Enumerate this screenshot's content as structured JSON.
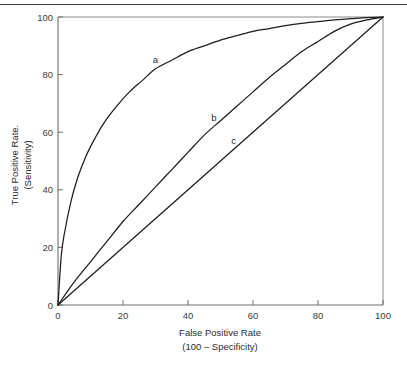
{
  "figure": {
    "has_top_rule": true,
    "background_color": "#ffffff",
    "ink_color": "#1d1d1d",
    "axis_color": "#6f6f6f"
  },
  "chart_data": {
    "type": "line",
    "title": "",
    "subtitle": "",
    "xlabel": "False Positive Rate",
    "xlabel_line2": "(100 – Specificity)",
    "ylabel": "True Positive Rate.",
    "ylabel_line2": "(Sensitivity)",
    "xlim": [
      0,
      100
    ],
    "ylim": [
      0,
      100
    ],
    "xticks": [
      0,
      20,
      40,
      60,
      80,
      100
    ],
    "yticks": [
      0,
      20,
      40,
      60,
      80,
      100
    ],
    "xtick_labels": [
      "0",
      "20",
      "40",
      "60",
      "80",
      "100"
    ],
    "ytick_labels": [
      "0",
      "20",
      "40",
      "60",
      "80",
      "100"
    ],
    "grid": false,
    "legend": "inline-curve-labels",
    "legend_position": "on-curve",
    "annotations": [
      {
        "text": "a",
        "x": 30,
        "y": 84
      },
      {
        "text": "b",
        "x": 48,
        "y": 64
      },
      {
        "text": "c",
        "x": 54,
        "y": 56
      }
    ],
    "series": [
      {
        "name": "a",
        "label": "a",
        "description": "excellent-discrimination ROC curve",
        "auc": 0.88,
        "x": [
          0,
          1,
          2,
          4,
          6,
          8,
          10,
          14,
          18,
          22,
          26,
          30,
          35,
          40,
          45,
          50,
          55,
          60,
          65,
          70,
          75,
          80,
          85,
          90,
          95,
          100
        ],
        "y": [
          0,
          17,
          25,
          36,
          44,
          50,
          55,
          63,
          69,
          74,
          78,
          82,
          85,
          88,
          90,
          92,
          93.5,
          95,
          96,
          97,
          97.8,
          98.4,
          99,
          99.4,
          99.8,
          100
        ]
      },
      {
        "name": "b",
        "label": "b",
        "description": "moderate-discrimination ROC curve",
        "auc": 0.65,
        "x": [
          0,
          5,
          10,
          15,
          20,
          25,
          30,
          35,
          40,
          45,
          50,
          55,
          60,
          65,
          70,
          75,
          80,
          85,
          90,
          95,
          100
        ],
        "y": [
          0,
          8,
          15,
          22,
          29,
          35,
          41,
          47,
          53,
          59,
          64,
          69,
          74,
          79,
          83.5,
          88,
          91.5,
          95,
          97.5,
          99,
          100
        ]
      },
      {
        "name": "c",
        "label": "c",
        "description": "chance diagonal, no discrimination",
        "auc": 0.5,
        "x": [
          0,
          100
        ],
        "y": [
          0,
          100
        ]
      }
    ]
  }
}
